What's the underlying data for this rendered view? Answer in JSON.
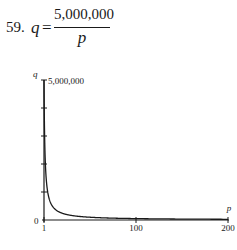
{
  "problem": {
    "number": "59.",
    "lhs": "q",
    "equals": "=",
    "numerator": "5,000,000",
    "denominator": "p"
  },
  "chart_data": {
    "type": "line",
    "xlabel": "p",
    "ylabel": "q",
    "xlim": [
      1,
      200
    ],
    "ylim": [
      0,
      5000000
    ],
    "x_ticks": [
      1,
      100,
      200
    ],
    "x_tick_labels": [
      "1",
      "100",
      "200"
    ],
    "y_ticks": [
      0,
      1000000,
      2000000,
      3000000,
      4000000,
      5000000
    ],
    "y_tick_labels": [
      "0",
      "",
      "",
      "",
      "",
      "5,000,000"
    ],
    "grid": false,
    "legend": null,
    "series": [
      {
        "name": "q = 5,000,000/p",
        "x": [
          1,
          1.25,
          1.5,
          2,
          2.5,
          3,
          4,
          5,
          6,
          8,
          10,
          15,
          20,
          30,
          40,
          50,
          75,
          100,
          150,
          200
        ],
        "values": [
          5000000,
          4000000,
          3333333,
          2500000,
          2000000,
          1666667,
          1250000,
          1000000,
          833333,
          625000,
          500000,
          333333,
          250000,
          166667,
          125000,
          100000,
          66667,
          50000,
          33333,
          25000
        ]
      }
    ]
  },
  "axes": {
    "x_label": "p",
    "y_label": "q",
    "y_max_label": "5,000,000",
    "y_zero_label": "0",
    "x_labels": [
      "1",
      "100",
      "200"
    ]
  },
  "colors": {
    "ink": "#1a1a1a",
    "background": "#ffffff"
  }
}
